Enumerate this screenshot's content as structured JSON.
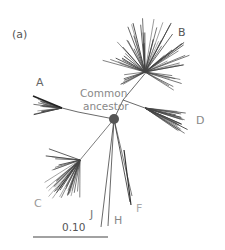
{
  "figure": {
    "panel_label": "(a)",
    "root_label_line1": "Common",
    "root_label_line2": "ancestor",
    "scale_bar_label": "0.10",
    "scale_bar_value": 0.1,
    "clades": [
      {
        "id": "A",
        "label": "A",
        "color": "#333333",
        "label_color": "#666666"
      },
      {
        "id": "B",
        "label": "B",
        "color": "#333333",
        "label_color": "#555555"
      },
      {
        "id": "C",
        "label": "C",
        "color": "#333333",
        "label_color": "#999999"
      },
      {
        "id": "D",
        "label": "D",
        "color": "#333333",
        "label_color": "#888888"
      },
      {
        "id": "F",
        "label": "F",
        "color": "#333333",
        "label_color": "#aaaaaa"
      },
      {
        "id": "H",
        "label": "H",
        "color": "#333333",
        "label_color": "#888888"
      },
      {
        "id": "J",
        "label": "J",
        "color": "#333333",
        "label_color": "#777777"
      }
    ],
    "root_node_color": "#555555"
  }
}
